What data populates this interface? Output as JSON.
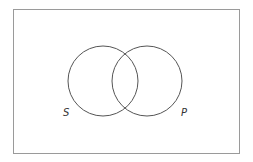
{
  "diagram": {
    "type": "venn",
    "sets": [
      {
        "label": "S"
      },
      {
        "label": "P"
      }
    ],
    "colors": {
      "border": "#9a9a9a",
      "circle": "#555555",
      "label": "#333333"
    }
  }
}
